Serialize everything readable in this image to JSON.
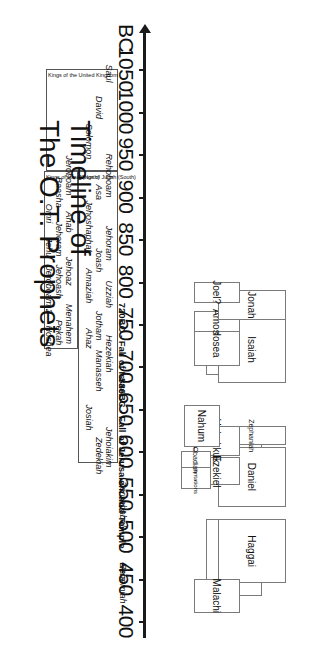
{
  "title": {
    "line1": "Timeline of",
    "line2": "The O.T. Prophets"
  },
  "axis": {
    "era_label": "BC",
    "ticks": [
      1050,
      1000,
      950,
      900,
      850,
      800,
      750,
      700,
      650,
      600,
      550,
      500,
      450,
      400
    ],
    "direction": "right-to-left (older on left)"
  },
  "chart_data": {
    "type": "timeline",
    "title": "Timeline of The O.T. Prophets",
    "xlabel": "BC",
    "xlim": [
      1075,
      385
    ],
    "axis_ticks": [
      1050,
      1000,
      950,
      900,
      850,
      800,
      750,
      700,
      650,
      600,
      550,
      500,
      450,
      400
    ],
    "grid": false,
    "legend": "none",
    "prophets": [
      {
        "name": "Zechariah",
        "start": 520,
        "end": 430,
        "lane": 1
      },
      {
        "name": "Haggai",
        "start": 520,
        "end": 445,
        "lane": 2
      },
      {
        "name": "Malachi",
        "start": 450,
        "end": 410,
        "lane": 3
      },
      {
        "name": "Jeremiah",
        "start": 627,
        "end": 570,
        "lane": 1
      },
      {
        "name": "Daniel",
        "start": 605,
        "end": 535,
        "lane": 2
      },
      {
        "name": "Ezekiel",
        "start": 593,
        "end": 560,
        "lane": 3
      },
      {
        "name": "Lamentations",
        "start": 586,
        "end": 556,
        "lane": 4
      },
      {
        "name": "Zephaniah",
        "start": 630,
        "end": 607,
        "lane": 2
      },
      {
        "name": "Habakkuk",
        "start": 630,
        "end": 595,
        "lane": 3
      },
      {
        "name": "Obadiah",
        "start": 600,
        "end": 580,
        "lane": 4
      },
      {
        "name": "Nahum",
        "start": 655,
        "end": 605,
        "lane": 5
      },
      {
        "name": "Micah",
        "start": 750,
        "end": 690,
        "lane": 1
      },
      {
        "name": "Isaiah",
        "start": 760,
        "end": 680,
        "lane": 2
      },
      {
        "name": "Hosea",
        "start": 755,
        "end": 700,
        "lane": 3
      },
      {
        "name": "Amos",
        "start": 765,
        "end": 740,
        "lane": 3
      },
      {
        "name": "Jonah",
        "start": 790,
        "end": 755,
        "lane": 2
      },
      {
        "name": "Joel?",
        "start": 800,
        "end": 775,
        "lane": 3
      }
    ],
    "events": [
      {
        "label": "586BC - Fall of Jerusalem and Temple",
        "year": 586
      },
      {
        "label": "720BC - Fall of Israel",
        "year": 720
      }
    ],
    "leaders": [
      {
        "name": "Zerubbabel",
        "year": 538
      },
      {
        "name": "Ezra",
        "year": 458
      },
      {
        "name": "Nehemiah",
        "year": 445
      }
    ],
    "eras": [
      {
        "title": "Kings of the United Kingdom",
        "start": 1050,
        "end": 930,
        "kings": [
          {
            "name": "Saul",
            "year": 1045
          },
          {
            "name": "David",
            "year": 1005
          },
          {
            "name": "Solomon",
            "year": 965
          }
        ]
      },
      {
        "title": "Kings of Judah (South)",
        "start": 930,
        "end": 586,
        "kings": [
          {
            "name": "Rehoboam",
            "year": 925
          },
          {
            "name": "Asa",
            "year": 905
          },
          {
            "name": "Jehoshaphat",
            "year": 865
          },
          {
            "name": "Jehoram",
            "year": 845
          },
          {
            "name": "Joash",
            "year": 825
          },
          {
            "name": "Amaziah",
            "year": 795
          },
          {
            "name": "Uzziah",
            "year": 785
          },
          {
            "name": "Jotham",
            "year": 748
          },
          {
            "name": "Ahaz",
            "year": 733
          },
          {
            "name": "Hezekiah",
            "year": 715
          },
          {
            "name": "Manasseh",
            "year": 695
          },
          {
            "name": "Josiah",
            "year": 640
          },
          {
            "name": "Jehoiakim",
            "year": 605
          },
          {
            "name": "Zedekiah",
            "year": 595
          }
        ]
      },
      {
        "title": "Kings of Israel (North)",
        "start": 930,
        "end": 720,
        "kings": [
          {
            "name": "Jeroboam",
            "year": 925
          },
          {
            "name": "Baasha",
            "year": 905
          },
          {
            "name": "Omri",
            "year": 880
          },
          {
            "name": "Ahab",
            "year": 870
          },
          {
            "name": "Jehoram",
            "year": 850
          },
          {
            "name": "Jehu",
            "year": 840
          },
          {
            "name": "Jehoaz",
            "year": 812
          },
          {
            "name": "Jehoash",
            "year": 800
          },
          {
            "name": "Jeroboam 2",
            "year": 790
          },
          {
            "name": "Menahem",
            "year": 750
          },
          {
            "name": "Pekah",
            "year": 740
          },
          {
            "name": "Hoshea",
            "year": 730
          }
        ]
      }
    ]
  }
}
